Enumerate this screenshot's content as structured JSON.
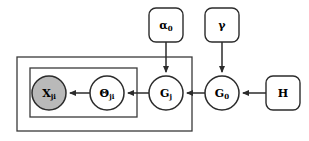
{
  "diagram": {
    "background_color": "#ffffff",
    "stroke_color": "#2b2b2b",
    "observed_fill_color": "#b9b9b9",
    "latent_fill_color": "#ffffff",
    "nodes": [
      {
        "id": "x",
        "symbol": "X",
        "subscript": "ji",
        "shape": "circle",
        "shaded": true,
        "cx": 49,
        "cy": 93,
        "r": 17
      },
      {
        "id": "theta",
        "symbol": "Θ",
        "subscript": "ji",
        "shape": "circle",
        "shaded": false,
        "cx": 107,
        "cy": 93,
        "r": 17
      },
      {
        "id": "gj",
        "symbol": "G",
        "subscript": "j",
        "shape": "circle",
        "shaded": false,
        "cx": 166,
        "cy": 93,
        "r": 17
      },
      {
        "id": "g0",
        "symbol": "G",
        "subscript": "0",
        "shape": "circle",
        "shaded": false,
        "cx": 222,
        "cy": 93,
        "r": 17
      }
    ],
    "parameters": [
      {
        "id": "alpha0",
        "symbol": "α",
        "subscript": "0",
        "shape": "rounded-rect",
        "x": 149,
        "y": 8,
        "width": 34,
        "height": 34
      },
      {
        "id": "gamma",
        "symbol": "γ",
        "subscript": "",
        "shape": "rounded-rect",
        "x": 205,
        "y": 8,
        "width": 34,
        "height": 34
      },
      {
        "id": "h",
        "symbol": "H",
        "subscript": "",
        "shape": "rounded-rect",
        "x": 266,
        "y": 76,
        "width": 34,
        "height": 34
      }
    ],
    "plates": [
      {
        "id": "outer-plate",
        "x": 17,
        "y": 57,
        "width": 175,
        "height": 74
      },
      {
        "id": "inner-plate",
        "x": 30,
        "y": 68,
        "width": 107,
        "height": 49
      }
    ],
    "edges": [
      {
        "id": "theta-to-x",
        "from": "theta",
        "to": "x",
        "orientation": "horizontal"
      },
      {
        "id": "gj-to-theta",
        "from": "gj",
        "to": "theta",
        "orientation": "horizontal"
      },
      {
        "id": "g0-to-gj",
        "from": "g0",
        "to": "gj",
        "orientation": "horizontal"
      },
      {
        "id": "h-to-g0",
        "from": "h",
        "to": "g0",
        "orientation": "horizontal"
      },
      {
        "id": "alpha0-to-gj",
        "from": "alpha0",
        "to": "gj",
        "orientation": "vertical"
      },
      {
        "id": "gamma-to-g0",
        "from": "gamma",
        "to": "g0",
        "orientation": "vertical"
      }
    ]
  }
}
